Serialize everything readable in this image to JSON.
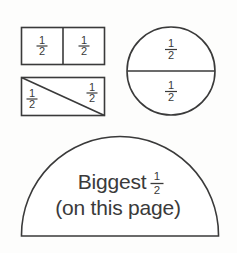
{
  "page": {
    "background_color": "#fdfdfc",
    "ink_color": "#3a3a3a"
  },
  "fraction": {
    "numerator": "1",
    "denominator": "2",
    "spoken": "one half"
  },
  "shapes": [
    {
      "id": "rectangle-vertical-split",
      "name": "rectangle split vertically into two halves",
      "kind": "rectangle",
      "split": "vertical",
      "parts": 2,
      "labels": [
        {
          "numerator": "1",
          "denominator": "2"
        },
        {
          "numerator": "1",
          "denominator": "2"
        }
      ]
    },
    {
      "id": "rectangle-diagonal-split",
      "name": "rectangle split diagonally into two triangular halves",
      "kind": "rectangle",
      "split": "diagonal",
      "parts": 2,
      "labels": [
        {
          "numerator": "1",
          "denominator": "2"
        },
        {
          "numerator": "1",
          "denominator": "2"
        }
      ]
    },
    {
      "id": "circle-horizontal-split",
      "name": "circle split horizontally into two halves",
      "kind": "circle",
      "split": "horizontal",
      "parts": 2,
      "labels": [
        {
          "numerator": "1",
          "denominator": "2"
        },
        {
          "numerator": "1",
          "denominator": "2"
        }
      ]
    },
    {
      "id": "semicircle-biggest-half",
      "name": "semicircle labelled biggest half on this page",
      "kind": "semicircle",
      "split": "none",
      "parts": 1,
      "caption_line1": "Biggest",
      "caption_line2": "(on this page)",
      "caption_fraction": {
        "numerator": "1",
        "denominator": "2"
      }
    }
  ]
}
